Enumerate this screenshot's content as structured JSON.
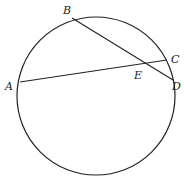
{
  "diagram": {
    "type": "intersecting-chords-in-circle",
    "points": {
      "A": "A",
      "B": "B",
      "C": "C",
      "D": "D",
      "E": "E"
    },
    "chords": [
      "AC",
      "BD"
    ],
    "intersection": "E",
    "caption": "(BE)(ED) = (AE)(EC)"
  }
}
